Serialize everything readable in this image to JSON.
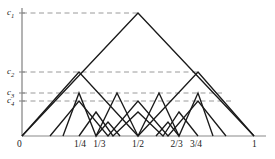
{
  "figure": {
    "kind": "tent-map-nested-triangles",
    "background": "#ffffff",
    "curve_color": "#1a1a1a",
    "axis_color": "#8a8a8a",
    "dash_color": "#9a9a9a"
  },
  "axes": {
    "x": {
      "label_zero": "0",
      "label_one": "1",
      "ticks": [
        {
          "value": 0.25,
          "label": "1/4"
        },
        {
          "value": 0.3333,
          "label": "1/3"
        },
        {
          "value": 0.5,
          "label": "1/2"
        },
        {
          "value": 0.6667,
          "label": "2/3"
        },
        {
          "value": 0.75,
          "label": "3/4"
        }
      ],
      "x0_px": 22,
      "x1_px": 254,
      "baseline_px": 136
    },
    "y": {
      "ticks": [
        {
          "name": "c1",
          "letter": "c",
          "sub": "1",
          "y_px": 13
        },
        {
          "name": "c2",
          "letter": "c",
          "sub": "2",
          "y_px": 72
        },
        {
          "name": "c3",
          "letter": "c",
          "sub": "3",
          "y_px": 93
        },
        {
          "name": "c4",
          "letter": "c",
          "sub": "4",
          "y_px": 101
        }
      ],
      "top_px": 8,
      "bottom_px": 136
    }
  },
  "chart_data": {
    "type": "line",
    "title": "",
    "xlabel": "",
    "ylabel": "",
    "xlim": [
      0,
      1
    ],
    "ylim": [
      0,
      1
    ],
    "grid": false,
    "legend": "none",
    "dashed_levels": [
      {
        "label": "c1",
        "y_px": 13,
        "x_end_px": 138
      },
      {
        "label": "c2",
        "y_px": 72,
        "x_end_px": 198
      },
      {
        "label": "c3",
        "y_px": 93,
        "x_end_px": 222
      },
      {
        "label": "c4",
        "y_px": 101,
        "x_end_px": 232
      }
    ],
    "polylines_px": [
      [
        [
          22,
          136
        ],
        [
          138,
          13
        ],
        [
          254,
          136
        ]
      ],
      [
        [
          22,
          136
        ],
        [
          79,
          72
        ],
        [
          138,
          136
        ]
      ],
      [
        [
          138,
          136
        ],
        [
          198,
          72
        ],
        [
          254,
          136
        ]
      ],
      [
        [
          50,
          136
        ],
        [
          79,
          101
        ],
        [
          108,
          136
        ],
        [
          138,
          101
        ],
        [
          168,
          136
        ],
        [
          198,
          101
        ],
        [
          226,
          136
        ]
      ],
      [
        [
          63,
          136
        ],
        [
          79,
          93
        ],
        [
          96,
          136
        ],
        [
          117,
          93
        ],
        [
          138,
          136
        ],
        [
          159,
          93
        ],
        [
          179,
          136
        ],
        [
          198,
          93
        ],
        [
          213,
          136
        ]
      ],
      [
        [
          79,
          136
        ],
        [
          96,
          112
        ],
        [
          113,
          136
        ],
        [
          138,
          112
        ],
        [
          163,
          136
        ],
        [
          179,
          112
        ],
        [
          198,
          136
        ]
      ],
      [
        [
          96,
          136
        ],
        [
          108,
          122
        ],
        [
          120,
          136
        ]
      ],
      [
        [
          156,
          136
        ],
        [
          168,
          122
        ],
        [
          179,
          136
        ]
      ]
    ]
  },
  "labels": {
    "origin": "0",
    "x_end": "1"
  }
}
